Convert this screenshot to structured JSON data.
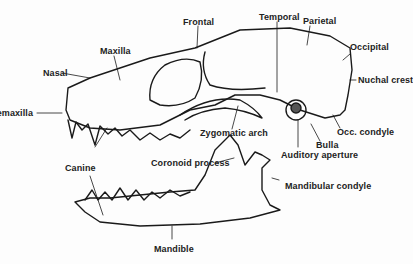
{
  "diagram": {
    "colors": {
      "ink": "#1a1a1a",
      "background": "#fdfdfd"
    },
    "labels": {
      "frontal": "Frontal",
      "temporal": "Temporal",
      "parietal": "Parietal",
      "occipital": "Occipital",
      "maxilla": "Maxilla",
      "nasal": "Nasal",
      "premaxilla": "Premaxilla",
      "nuchal_crest": "Nuchal crest",
      "zygomatic_arch": "Zygomatic arch",
      "occ_condyle": "Occ. condyle",
      "bulla": "Bulla",
      "auditory_aperture": "Auditory aperture",
      "canine": "Canine",
      "coronoid_process": "Coronoid process",
      "mandibular_condyle": "Mandibular condyle",
      "mandible": "Mandible"
    }
  }
}
